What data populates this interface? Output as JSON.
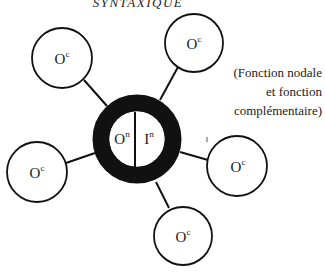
{
  "title": "SYNTAXIQUE",
  "center_node": {
    "left_label": "O",
    "left_sup": "n",
    "right_label": "I",
    "right_sup": "n"
  },
  "satellites": [
    {
      "id": "top-left",
      "label": "O",
      "sup": "c"
    },
    {
      "id": "top-right",
      "label": "O",
      "sup": "c"
    },
    {
      "id": "left",
      "label": "O",
      "sup": "c"
    },
    {
      "id": "right",
      "label": "O",
      "sup": "c"
    },
    {
      "id": "bottom",
      "label": "O",
      "sup": "c"
    }
  ],
  "caption": {
    "line1": "(Fonction nodale",
    "line2": "et fonction",
    "line3": "complémentaire)"
  },
  "colors": {
    "ink": "#111111",
    "background": "#ffffff"
  }
}
